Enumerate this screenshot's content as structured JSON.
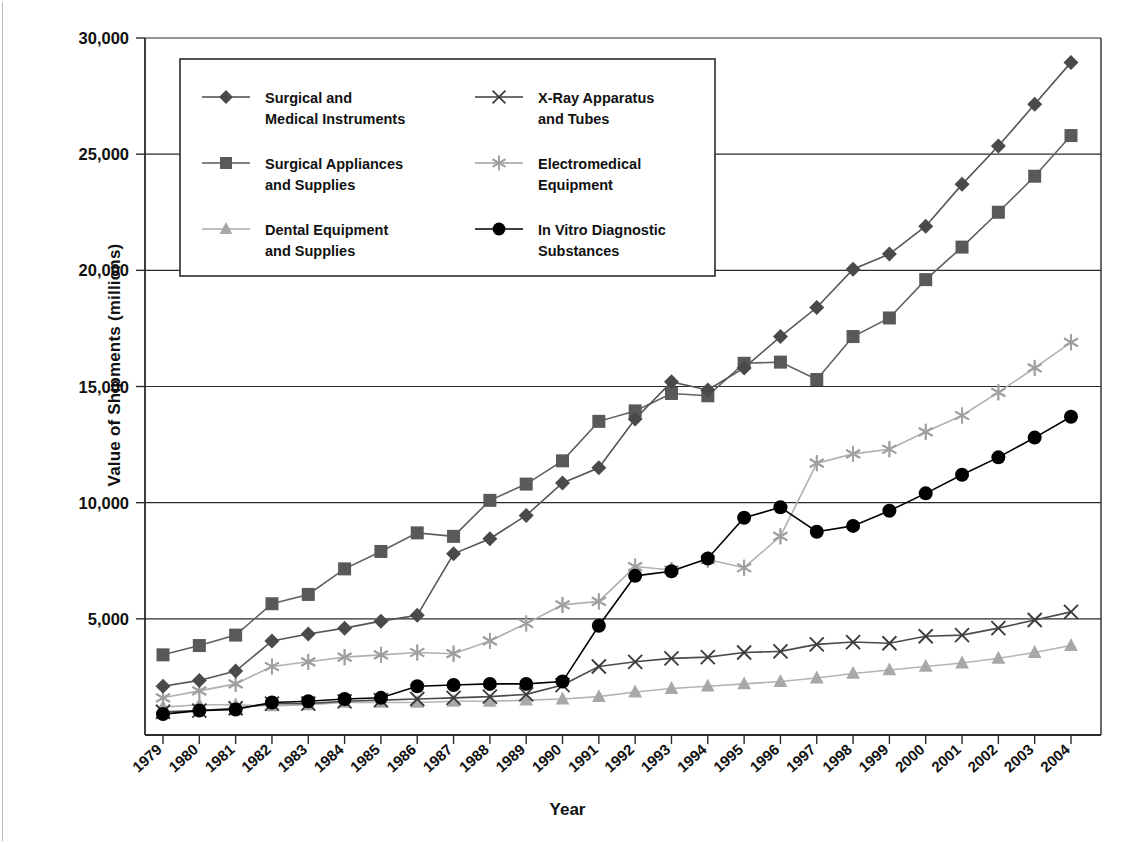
{
  "chart_data": {
    "type": "line",
    "title": "",
    "xlabel": "Year",
    "ylabel": "Value of Shipments (millions)",
    "grid": true,
    "legend_position": "top-center-inside",
    "xlim": [
      1979,
      2004
    ],
    "ylim": [
      0,
      30000
    ],
    "yticks": [
      5000,
      10000,
      15000,
      20000,
      25000,
      30000
    ],
    "ytick_labels": [
      "5,000",
      "10,000",
      "15,000",
      "20,000",
      "25,000",
      "30,000"
    ],
    "categories": [
      1979,
      1980,
      1981,
      1982,
      1983,
      1984,
      1985,
      1986,
      1987,
      1988,
      1989,
      1990,
      1991,
      1992,
      1993,
      1994,
      1995,
      1996,
      1997,
      1998,
      1999,
      2000,
      2001,
      2002,
      2003,
      2004
    ],
    "xtick_labels": [
      "1979",
      "1980",
      "1981",
      "1982",
      "1983",
      "1984",
      "1985",
      "1986",
      "1987",
      "1988",
      "1989",
      "1990",
      "1991",
      "1992",
      "1993",
      "1994",
      "1995",
      "1996",
      "1997",
      "1998",
      "1999",
      "2000",
      "2001",
      "2002",
      "2003",
      "2004"
    ],
    "series": [
      {
        "name": "Surgical and Medical Instruments",
        "marker": "diamond",
        "color": "#4a4a4a",
        "line_color": "#555555",
        "values": [
          2100,
          2350,
          2750,
          4050,
          4350,
          4600,
          4900,
          5150,
          7800,
          8450,
          9450,
          10850,
          11500,
          13600,
          15200,
          14850,
          15800,
          17150,
          18400,
          20050,
          20700,
          21900,
          23700,
          25350,
          27150,
          28950
        ]
      },
      {
        "name": "Surgical Appliances and Supplies",
        "marker": "square",
        "color": "#595959",
        "line_color": "#606060",
        "values": [
          3450,
          3850,
          4300,
          5650,
          6050,
          7150,
          7900,
          8700,
          8550,
          10100,
          10800,
          11800,
          13500,
          13950,
          14700,
          14600,
          16000,
          16050,
          15300,
          17150,
          17950,
          19600,
          21000,
          22500,
          24050,
          25800
        ]
      },
      {
        "name": "Dental Equipment and Supplies",
        "marker": "triangle",
        "color": "#a8a8a8",
        "line_color": "#b4b4b4",
        "values": [
          1200,
          1300,
          1300,
          1250,
          1300,
          1400,
          1400,
          1400,
          1450,
          1450,
          1500,
          1550,
          1650,
          1850,
          2000,
          2100,
          2200,
          2300,
          2450,
          2650,
          2800,
          2950,
          3100,
          3300,
          3550,
          3850
        ]
      },
      {
        "name": "X-Ray Apparatus and Tubes",
        "marker": "cross",
        "color": "#3c3c3c",
        "line_color": "#4b4b4b",
        "values": [
          1000,
          1050,
          1150,
          1350,
          1350,
          1450,
          1500,
          1550,
          1600,
          1650,
          1750,
          2150,
          2950,
          3150,
          3300,
          3350,
          3550,
          3600,
          3900,
          4000,
          3950,
          4250,
          4300,
          4600,
          4950,
          5300
        ]
      },
      {
        "name": "Electromedical Equipment",
        "marker": "asterisk",
        "color": "#a0a0a0",
        "line_color": "#b0b0b0",
        "values": [
          1600,
          1900,
          2200,
          2950,
          3150,
          3350,
          3450,
          3550,
          3500,
          4050,
          4800,
          5600,
          5750,
          7250,
          7100,
          7550,
          7200,
          8550,
          11700,
          12100,
          12300,
          13050,
          13750,
          14750,
          15800,
          16900
        ]
      },
      {
        "name": "In Vitro Diagnostic Substances",
        "marker": "circle",
        "color": "#000000",
        "line_color": "#000000",
        "values": [
          900,
          1050,
          1100,
          1400,
          1450,
          1550,
          1600,
          2100,
          2150,
          2200,
          2200,
          2300,
          4700,
          6850,
          7050,
          7600,
          9350,
          9800,
          8750,
          9000,
          9650,
          10400,
          11200,
          11950,
          12800,
          13700
        ]
      }
    ]
  },
  "legend": {
    "items": [
      {
        "label_line1": "Surgical and",
        "label_line2": "Medical Instruments",
        "marker": "diamond",
        "color": "#4a4a4a"
      },
      {
        "label_line1": "X-Ray Apparatus",
        "label_line2": "and Tubes",
        "marker": "cross",
        "color": "#3c3c3c"
      },
      {
        "label_line1": "Surgical Appliances",
        "label_line2": "and Supplies",
        "marker": "square",
        "color": "#595959"
      },
      {
        "label_line1": "Electromedical",
        "label_line2": "Equipment",
        "marker": "asterisk",
        "color": "#a0a0a0"
      },
      {
        "label_line1": "Dental Equipment",
        "label_line2": "and Supplies",
        "marker": "triangle",
        "color": "#a8a8a8"
      },
      {
        "label_line1": "In Vitro Diagnostic",
        "label_line2": "Substances",
        "marker": "circle",
        "color": "#000000"
      }
    ]
  },
  "axes": {
    "y_title": "Value of Shipments (millions)",
    "x_title": "Year"
  }
}
